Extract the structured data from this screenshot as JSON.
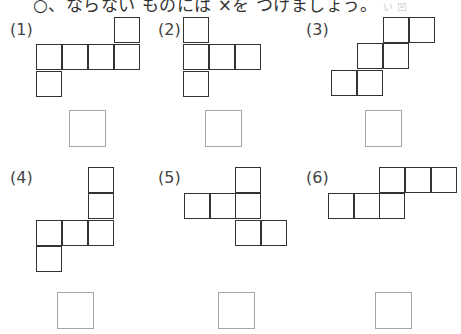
{
  "instruction": {
    "text": "○、ならない ものには ×を つけましょう。",
    "faint_text": "い 凹"
  },
  "problems": [
    {
      "label": "(1)",
      "label_pos": [
        10,
        20
      ],
      "answer_box": [
        69,
        110
      ],
      "squares": [
        [
          114,
          17
        ],
        [
          36,
          44
        ],
        [
          62,
          44
        ],
        [
          88,
          44
        ],
        [
          114,
          44
        ],
        [
          36,
          71
        ]
      ]
    },
    {
      "label": "(2)",
      "label_pos": [
        158,
        20
      ],
      "answer_box": [
        205,
        110
      ],
      "squares": [
        [
          183,
          17
        ],
        [
          183,
          44
        ],
        [
          209,
          44
        ],
        [
          235,
          44
        ],
        [
          183,
          71
        ]
      ]
    },
    {
      "label": "(3)",
      "label_pos": [
        306,
        20
      ],
      "answer_box": [
        365,
        110
      ],
      "squares": [
        [
          383,
          17
        ],
        [
          409,
          17
        ],
        [
          357,
          43
        ],
        [
          383,
          43
        ],
        [
          331,
          70
        ],
        [
          357,
          70
        ]
      ]
    },
    {
      "label": "(4)",
      "label_pos": [
        10,
        168
      ],
      "answer_box": [
        57,
        292
      ],
      "squares": [
        [
          88,
          167
        ],
        [
          88,
          193
        ],
        [
          36,
          220
        ],
        [
          62,
          220
        ],
        [
          88,
          220
        ],
        [
          36,
          246
        ]
      ]
    },
    {
      "label": "(5)",
      "label_pos": [
        158,
        168
      ],
      "answer_box": [
        218,
        292
      ],
      "squares": [
        [
          235,
          167
        ],
        [
          184,
          193
        ],
        [
          210,
          193
        ],
        [
          235,
          193
        ],
        [
          235,
          220
        ],
        [
          261,
          220
        ]
      ]
    },
    {
      "label": "(6)",
      "label_pos": [
        306,
        168
      ],
      "answer_box": [
        375,
        292
      ],
      "squares": [
        [
          379,
          167
        ],
        [
          405,
          167
        ],
        [
          431,
          167
        ],
        [
          328,
          193
        ],
        [
          354,
          193
        ],
        [
          379,
          193
        ]
      ]
    }
  ],
  "colors": {
    "line": "#333333",
    "answer_border": "#a6a6a6"
  }
}
